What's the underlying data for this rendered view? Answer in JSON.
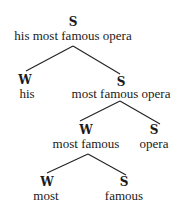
{
  "diagram": {
    "type": "metrical-tree",
    "nodes": {
      "root": {
        "label": "S",
        "text": "his most famous opera"
      },
      "n1": {
        "label": "W",
        "text": "his"
      },
      "n2": {
        "label": "S",
        "text": "most famous opera"
      },
      "n2_w": {
        "label": "W",
        "text": "most famous"
      },
      "n2_s": {
        "label": "S",
        "text": "opera"
      },
      "n2_w_w": {
        "label": "W",
        "text": "most"
      },
      "n2_w_s": {
        "label": "S",
        "text": "famous"
      }
    },
    "edges": [
      {
        "from": "root",
        "to": "n1"
      },
      {
        "from": "root",
        "to": "n2"
      },
      {
        "from": "n2",
        "to": "n2_w"
      },
      {
        "from": "n2",
        "to": "n2_s"
      },
      {
        "from": "n2_w",
        "to": "n2_w_w"
      },
      {
        "from": "n2_w",
        "to": "n2_w_s"
      }
    ]
  }
}
